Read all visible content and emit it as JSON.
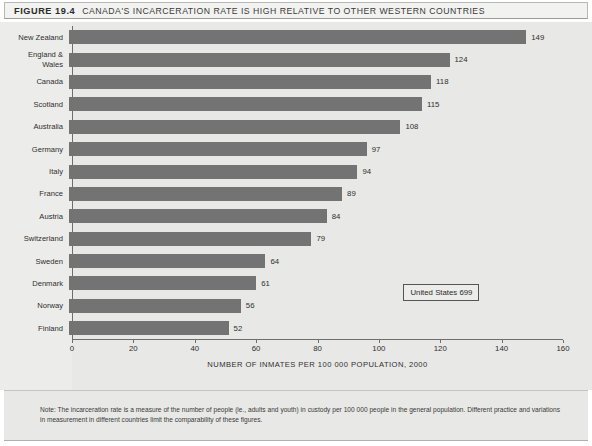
{
  "figure": {
    "number_label": "FIGURE 19.4",
    "title": "CANADA'S INCARCERATION RATE IS HIGH RELATIVE TO OTHER WESTERN COUNTRIES",
    "note": "Note: The incarceration rate is a measure of the number of people (ie., adults and youth) in custody per 100 000 people in the general population. Different practice and variations in measurement in different countries limit the comparability of these figures.",
    "callout": "United States 699"
  },
  "colors": {
    "bar": "#737373",
    "panel_background": "#e8e8e6",
    "title_background": "#f2f2f0",
    "axis": "#6e6e6e",
    "text": "#2f2f2f"
  },
  "chart_data": {
    "type": "bar",
    "orientation": "horizontal",
    "title": "CANADA'S INCARCERATION RATE IS HIGH RELATIVE TO OTHER WESTERN COUNTRIES",
    "subtitle": "",
    "xlabel": "NUMBER OF INMATES PER 100 000 POPULATION, 2000",
    "ylabel": "",
    "xlim": [
      0,
      160
    ],
    "xticks": [
      0,
      20,
      40,
      60,
      80,
      100,
      120,
      140,
      160
    ],
    "xtick_labels": [
      "0",
      "20",
      "40",
      "60",
      "80",
      "100",
      "120",
      "140",
      "160"
    ],
    "grid": false,
    "legend": "none",
    "categories": [
      "New Zealand",
      "England &\nWales",
      "Canada",
      "Scotland",
      "Australia",
      "Germany",
      "Italy",
      "France",
      "Austria",
      "Switzerland",
      "Sweden",
      "Denmark",
      "Norway",
      "Finland"
    ],
    "values": [
      149,
      124,
      118,
      115,
      108,
      97,
      94,
      89,
      84,
      79,
      64,
      61,
      56,
      52
    ],
    "value_labels": [
      "149",
      "124",
      "118",
      "115",
      "108",
      "97",
      "94",
      "89",
      "84",
      "79",
      "64",
      "61",
      "56",
      "52"
    ],
    "annotations": [
      {
        "text": "United States 699",
        "value": 699
      }
    ]
  }
}
